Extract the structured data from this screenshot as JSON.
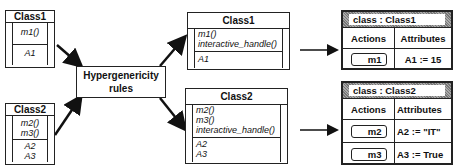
{
  "source_classes": [
    {
      "name": "Class1",
      "methods": [
        "m1()"
      ],
      "attributes": [
        "A1"
      ]
    },
    {
      "name": "Class2",
      "methods": [
        "m2()",
        "m3()"
      ],
      "attributes": [
        "A2",
        "A3"
      ]
    }
  ],
  "rules": {
    "line1": "Hypergenericity",
    "line2": "rules"
  },
  "generated_classes": [
    {
      "name": "Class1",
      "methods": [
        "m1()",
        "interactive_handle()"
      ],
      "attributes": [
        "A1"
      ]
    },
    {
      "name": "Class2",
      "methods": [
        "m2()",
        "m3()",
        "interactive_handle()"
      ],
      "attributes": [
        "A2",
        "A3"
      ]
    }
  ],
  "panels": [
    {
      "title": "class : Class1",
      "actions_header": "Actions",
      "attributes_header": "Attributes",
      "rows": [
        {
          "action": "m1",
          "attribute": "A1 := 15"
        }
      ]
    },
    {
      "title": "class : Class2",
      "actions_header": "Actions",
      "attributes_header": "Attributes",
      "rows": [
        {
          "action": "m2",
          "attribute": "A2 := \"IT\""
        },
        {
          "action": "m3",
          "attribute": "A3 := True"
        }
      ]
    }
  ]
}
